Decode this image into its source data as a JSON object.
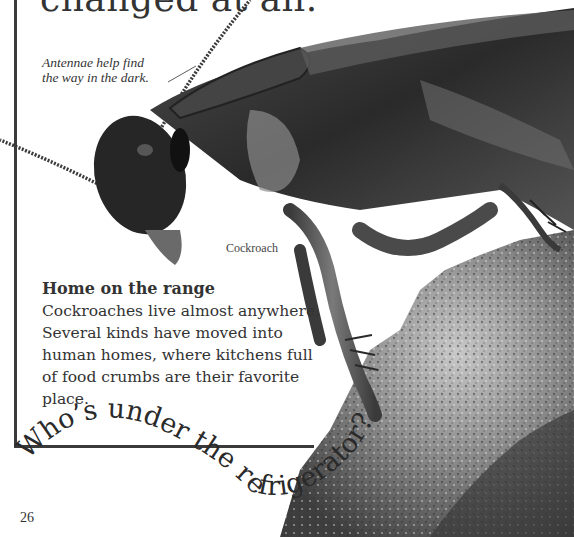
{
  "page": {
    "headline_fragment": "changed at all.",
    "antenna_caption": [
      "Antennae help find",
      "the way in the dark."
    ],
    "specimen_label": "Cockroach",
    "section": {
      "title": "Home on the range",
      "text": "Cockroaches live almost anywhere. Several kinds have moved into human homes, where kitchens full of food crumbs are their favorite place."
    },
    "curved_heading": "Who’s under the refrigerator?",
    "page_number": "26"
  },
  "colors": {
    "border": "#3a3a3a",
    "text": "#333333",
    "insect_dark": "#2b2b2b",
    "insect_mid": "#5a5a5a",
    "crumb_light": "#b5b5b5",
    "crumb_dark": "#4a4a4a"
  }
}
